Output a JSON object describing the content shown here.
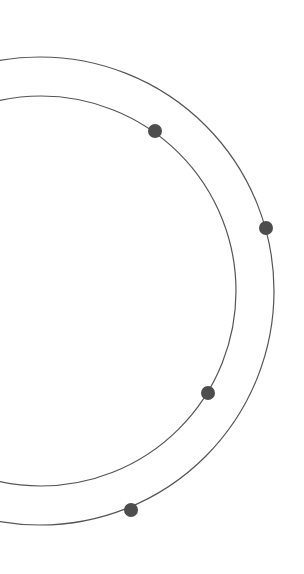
{
  "graphic": {
    "width": 304,
    "height": 574,
    "background": "#ffffff",
    "stroke_color": "#555555",
    "dot_color": "#4d4d4d",
    "rings": [
      {
        "name": "outer-ring",
        "cx": 40,
        "cy": 291,
        "r": 234
      },
      {
        "name": "inner-ring",
        "cx": 41,
        "cy": 291,
        "r": 195
      }
    ],
    "dots": [
      {
        "name": "inner-ring-dot-top",
        "cx": 155,
        "cy": 131,
        "r": 7
      },
      {
        "name": "outer-ring-dot-right",
        "cx": 266,
        "cy": 228,
        "r": 7
      },
      {
        "name": "inner-ring-dot-bottom",
        "cx": 208,
        "cy": 393,
        "r": 7
      },
      {
        "name": "outer-ring-dot-bottom",
        "cx": 131,
        "cy": 510,
        "r": 7
      }
    ]
  }
}
